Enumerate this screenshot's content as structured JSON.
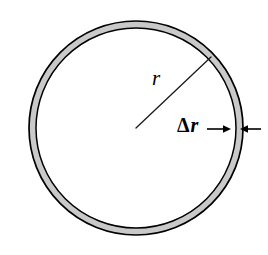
{
  "figure": {
    "type": "geometry-diagram",
    "background_color": "#ffffff",
    "labels": {
      "radius": "r",
      "thickness_delta": "Δ",
      "thickness_var": "r",
      "thickness_full": "Δr"
    },
    "colors": {
      "band_fill": "#c9c9c9",
      "outline": "#000000",
      "leader_line": "#1a1a1a",
      "arrow": "#000000"
    },
    "geometry": {
      "center_x": 136,
      "center_y": 128,
      "outer_radius": 107,
      "inner_radius": 100,
      "band_thickness": 7,
      "outline_width": 1.6,
      "radius_line_angle_deg": 28,
      "radius_line_start_x": 136,
      "radius_line_start_y": 128,
      "radius_line_end_x": 211,
      "radius_line_end_y": 57
    },
    "arrows": {
      "left_arrow_start_x": 207,
      "left_arrow_end_x": 227,
      "right_arrow_start_x": 261,
      "right_arrow_end_x": 243,
      "arrow_y": 129
    }
  }
}
